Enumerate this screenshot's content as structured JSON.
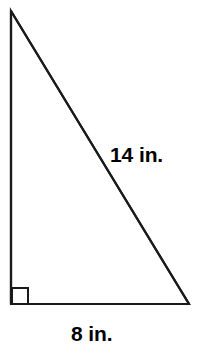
{
  "figure": {
    "kind": "right-triangle-diagram",
    "background_color": "#ffffff",
    "stroke_color": "#1a1a1a",
    "text_color": "#000000",
    "canvas": {
      "width": 199,
      "height": 360
    },
    "vertices": {
      "apex": {
        "x": 11,
        "y": 11
      },
      "bottom_left": {
        "x": 11,
        "y": 304
      },
      "bottom_right": {
        "x": 189,
        "y": 304
      }
    },
    "right_angle_marker": {
      "name": "right-angle-square",
      "x": 11,
      "y": 287,
      "size": 17,
      "at_vertex": "bottom_left"
    },
    "sides": {
      "hypotenuse_label": "14 in.",
      "base_label": "8 in.",
      "vertical_label": ""
    }
  },
  "labels": {
    "hypotenuse": "14 in.",
    "base": "8 in."
  }
}
